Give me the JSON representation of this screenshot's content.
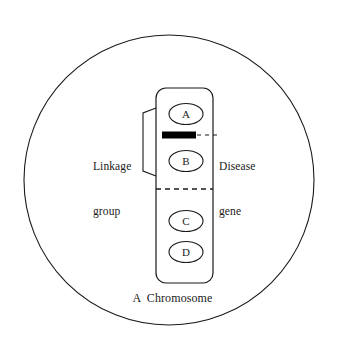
{
  "figure": {
    "caption": "A  Chromosome",
    "background_color": "#ffffff",
    "stroke_color": "#1a1a1a"
  },
  "circle": {
    "name": "cell-boundary",
    "center_x": 169,
    "center_y": 180,
    "radius": 145
  },
  "chromosome": {
    "name": "chromosome-body",
    "x": 156,
    "y": 88,
    "width": 57,
    "height": 195,
    "corner_radius": 10
  },
  "loci": [
    {
      "label": "A",
      "cx": 186,
      "cy": 114,
      "rx": 17,
      "ry": 10.5
    },
    {
      "label": "B",
      "cx": 186,
      "cy": 161,
      "rx": 17,
      "ry": 10.5
    },
    {
      "label": "C",
      "cx": 186,
      "cy": 221,
      "rx": 17,
      "ry": 10.5
    },
    {
      "label": "D",
      "cx": 186,
      "cy": 252,
      "rx": 17,
      "ry": 10.5
    }
  ],
  "disease_gene": {
    "name": "disease-gene-bar",
    "x": 162,
    "y": 131,
    "width": 34,
    "height": 7,
    "color": "#000000"
  },
  "labels": {
    "linkage_line1": "Linkage",
    "linkage_line2": "group",
    "disease_line1": "Disease",
    "disease_line2": "gene"
  },
  "divider": {
    "name": "centromere-dashed-divider",
    "y": 189,
    "x1": 156,
    "x2": 213,
    "dash": "5 4"
  },
  "leader": {
    "name": "disease-gene-leader-line",
    "y": 135,
    "x1": 197,
    "x2": 217,
    "dash": "4 4"
  },
  "bracket": {
    "name": "linkage-group-bracket",
    "top_y": 108,
    "bottom_y": 176,
    "right_x": 156,
    "left_x": 142
  }
}
